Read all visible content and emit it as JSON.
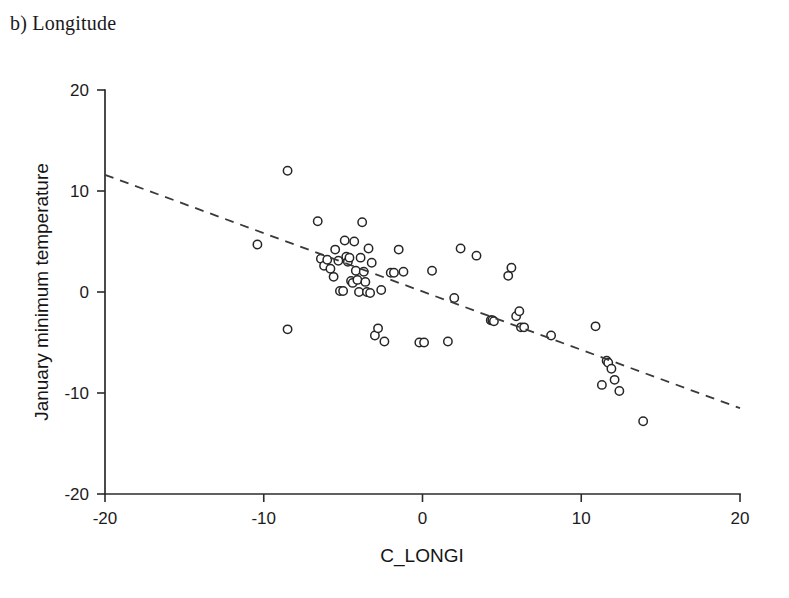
{
  "panel": {
    "label": "b) Longitude"
  },
  "chart_data": {
    "type": "scatter",
    "title": "b) Longitude",
    "xlabel": "C_LONGI",
    "ylabel": "January minimum temperature",
    "xlim": [
      -20,
      20
    ],
    "ylim": [
      -20,
      20
    ],
    "xticks": [
      -20,
      -10,
      0,
      10,
      20
    ],
    "yticks": [
      -20,
      -10,
      0,
      10,
      20
    ],
    "xtick_labels": [
      "-20",
      "-10",
      "0",
      "10",
      "20"
    ],
    "ytick_labels": [
      "-20",
      "-10",
      "0",
      "10",
      "20"
    ],
    "grid": false,
    "legend": false,
    "marker": "open-circle",
    "marker_fill": "#ffffff",
    "marker_stroke": "#262626",
    "points": [
      [
        -10.4,
        4.7
      ],
      [
        -8.5,
        12.0
      ],
      [
        -8.5,
        -3.7
      ],
      [
        -6.6,
        7.0
      ],
      [
        -6.4,
        3.3
      ],
      [
        -6.2,
        2.6
      ],
      [
        -6.0,
        3.2
      ],
      [
        -5.8,
        2.3
      ],
      [
        -5.6,
        1.5
      ],
      [
        -5.5,
        4.2
      ],
      [
        -5.3,
        3.1
      ],
      [
        -5.2,
        0.1
      ],
      [
        -5.0,
        0.1
      ],
      [
        -4.9,
        5.1
      ],
      [
        -4.8,
        3.5
      ],
      [
        -4.7,
        3.0
      ],
      [
        -4.6,
        3.4
      ],
      [
        -4.5,
        1.1
      ],
      [
        -4.4,
        0.9
      ],
      [
        -4.3,
        5.0
      ],
      [
        -4.2,
        2.1
      ],
      [
        -4.1,
        1.2
      ],
      [
        -4.0,
        0.0
      ],
      [
        -3.9,
        3.4
      ],
      [
        -3.8,
        6.9
      ],
      [
        -3.7,
        2.0
      ],
      [
        -3.6,
        1.0
      ],
      [
        -3.5,
        0.0
      ],
      [
        -3.4,
        4.3
      ],
      [
        -3.3,
        -0.1
      ],
      [
        -3.2,
        2.9
      ],
      [
        -3.0,
        -4.3
      ],
      [
        -2.8,
        -3.6
      ],
      [
        -2.6,
        0.2
      ],
      [
        -2.4,
        -4.9
      ],
      [
        -2.0,
        1.9
      ],
      [
        -1.8,
        1.9
      ],
      [
        -1.5,
        4.2
      ],
      [
        -1.2,
        2.0
      ],
      [
        -0.2,
        -5.0
      ],
      [
        0.1,
        -5.0
      ],
      [
        0.6,
        2.1
      ],
      [
        1.6,
        -4.9
      ],
      [
        2.0,
        -0.6
      ],
      [
        2.4,
        4.3
      ],
      [
        3.4,
        3.6
      ],
      [
        4.3,
        -2.8
      ],
      [
        4.4,
        -2.8
      ],
      [
        4.5,
        -2.9
      ],
      [
        5.4,
        1.6
      ],
      [
        5.6,
        2.4
      ],
      [
        5.9,
        -2.4
      ],
      [
        6.1,
        -1.9
      ],
      [
        6.2,
        -3.5
      ],
      [
        6.4,
        -3.5
      ],
      [
        8.1,
        -4.3
      ],
      [
        10.9,
        -3.4
      ],
      [
        11.3,
        -9.2
      ],
      [
        11.6,
        -6.8
      ],
      [
        11.7,
        -7.0
      ],
      [
        11.9,
        -7.6
      ],
      [
        12.1,
        -8.7
      ],
      [
        12.4,
        -9.8
      ],
      [
        13.9,
        -12.8
      ]
    ],
    "trend": {
      "style": "dashed",
      "x": [
        -20,
        20
      ],
      "y": [
        11.6,
        -11.5
      ],
      "slope": -0.5775,
      "intercept": 0.05
    }
  }
}
